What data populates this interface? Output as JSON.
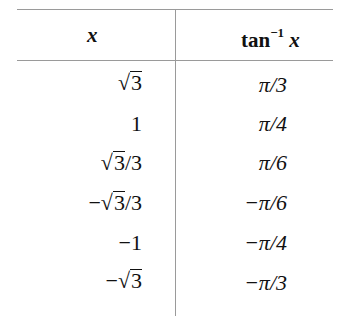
{
  "table": {
    "headers": {
      "x": "x",
      "tan_base": "tan",
      "tan_sup": "−1",
      "tan_var": "x"
    },
    "rows": [
      {
        "x_sign": "",
        "x_sqrt": "3",
        "x_rest": "",
        "x_plain": "",
        "tan": "π/3"
      },
      {
        "x_sign": "",
        "x_sqrt": "",
        "x_rest": "",
        "x_plain": "1",
        "tan": "π/4"
      },
      {
        "x_sign": "",
        "x_sqrt": "3",
        "x_rest": "/3",
        "x_plain": "",
        "tan": "π/6"
      },
      {
        "x_sign": "−",
        "x_sqrt": "3",
        "x_rest": "/3",
        "x_plain": "",
        "tan": "−π/6"
      },
      {
        "x_sign": "",
        "x_sqrt": "",
        "x_rest": "",
        "x_plain": "−1",
        "tan": "−π/4"
      },
      {
        "x_sign": "−",
        "x_sqrt": "3",
        "x_rest": "",
        "x_plain": "",
        "tan": "−π/3"
      }
    ]
  }
}
